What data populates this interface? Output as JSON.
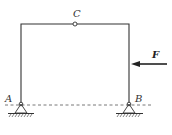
{
  "diagram": {
    "type": "three-hinged frame",
    "labels": {
      "hinge_top": "C",
      "support_left": "A",
      "support_right": "B",
      "force": "F"
    },
    "force": {
      "direction": "leftward",
      "applied_to": "right column"
    },
    "supports": [
      "pinned",
      "pinned"
    ],
    "reference_line": "dashed horizontal through A and B",
    "colors": {
      "line": "#333333",
      "background": "#ffffff"
    }
  }
}
